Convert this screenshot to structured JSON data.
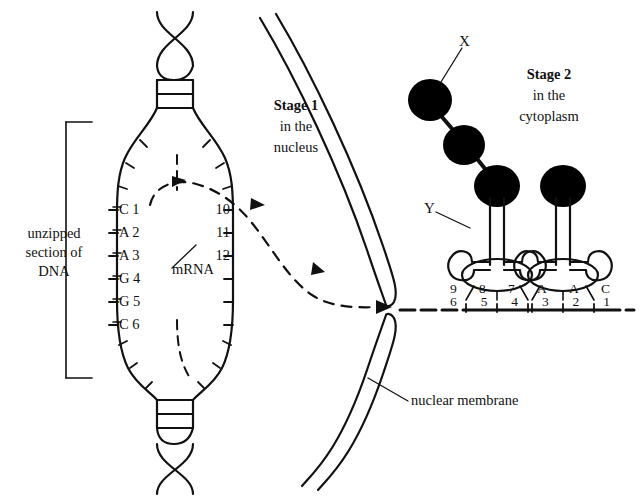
{
  "diagram": {
    "colors": {
      "ink": "#111111",
      "fill": "#000000",
      "background": "#ffffff"
    }
  },
  "labels": {
    "unzipped_dna": {
      "line1": "unzipped",
      "line2": "section of",
      "line3": "DNA"
    },
    "stage1": {
      "heading": "Stage 1",
      "line2": "in the",
      "line3": "nucleus"
    },
    "stage2": {
      "heading": "Stage 2",
      "line2": "in the",
      "line3": "cytoplasm"
    },
    "mrna": "mRNA",
    "nuclear_membrane": "nuclear membrane",
    "x_label": "X",
    "y_label": "Y"
  },
  "dna": {
    "left_strand_bases": [
      {
        "base": "C",
        "number": "1"
      },
      {
        "base": "A",
        "number": "2"
      },
      {
        "base": "A",
        "number": "3"
      },
      {
        "base": "G",
        "number": "4"
      },
      {
        "base": "G",
        "number": "5"
      },
      {
        "base": "C",
        "number": "6"
      }
    ],
    "right_strand_numbers": [
      "10",
      "11",
      "12"
    ]
  },
  "mrna_strand": {
    "anticodon_row": [
      "9",
      "8",
      "7",
      "A",
      "A",
      "C"
    ],
    "codon_row": [
      "6",
      "5",
      "4",
      "3",
      "2",
      "1"
    ]
  },
  "polypeptide": {
    "bead_count": "3"
  },
  "trna": {
    "count": "2"
  }
}
